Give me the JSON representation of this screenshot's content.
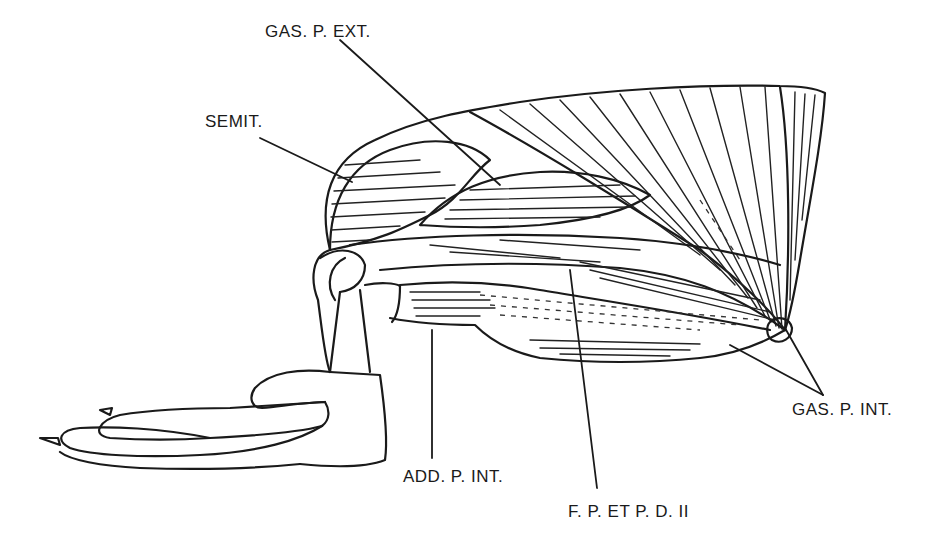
{
  "figure": {
    "background": "#ffffff",
    "ink": "#1a1a1a"
  },
  "labels": {
    "gas_p_ext": "GAS. P. EXT.",
    "semit": "SEMIT.",
    "gas_p_int": "GAS. P. INT.",
    "add_p_int": "ADD. P. INT.",
    "f_p_et_p_d_ii": "F. P. ET P. D. II"
  }
}
